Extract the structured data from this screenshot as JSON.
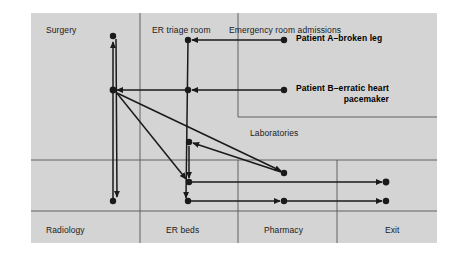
{
  "diagram": {
    "background_color": "#ffffff",
    "panel_color": "#d4d4d4",
    "line_color": "#1a1a1a",
    "grid_color": "#555555",
    "zones": [
      {
        "id": "surgery",
        "label": "Surgery",
        "x": 46,
        "y": 25,
        "align": "left"
      },
      {
        "id": "er-triage",
        "label": "ER triage room",
        "x": 152,
        "y": 25,
        "align": "left"
      },
      {
        "id": "er-admit",
        "label": "Emergency room admissions",
        "x": 229,
        "y": 25,
        "align": "left"
      },
      {
        "id": "laboratories",
        "label": "Laboratories",
        "x": 250,
        "y": 128,
        "align": "left"
      },
      {
        "id": "radiology",
        "label": "Radiology",
        "x": 46,
        "y": 225,
        "align": "left"
      },
      {
        "id": "er-beds",
        "label": "ER beds",
        "x": 166,
        "y": 225,
        "align": "left"
      },
      {
        "id": "pharmacy",
        "label": "Pharmacy",
        "x": 264,
        "y": 225,
        "align": "left"
      },
      {
        "id": "exit",
        "label": "Exit",
        "x": 385,
        "y": 225,
        "align": "left"
      }
    ],
    "patients": [
      {
        "id": "patient-a",
        "line1": "Patient A–broken leg",
        "line2": "",
        "x": 296,
        "y": 33
      },
      {
        "id": "patient-b",
        "line1": "Patient B–erratic heart",
        "line2": "pacemaker",
        "x": 296,
        "y": 83
      }
    ],
    "grid_lines": [
      {
        "id": "vline-surgery-erbeds",
        "orientation": "vertical",
        "x1": 140,
        "y1": 13,
        "x2": 140,
        "y2": 243
      },
      {
        "id": "vline-ertriage-right",
        "orientation": "vertical",
        "x1": 238,
        "y1": 13,
        "x2": 238,
        "y2": 117
      },
      {
        "id": "vline-lab-pharmacy",
        "orientation": "vertical",
        "x1": 238,
        "y1": 160,
        "x2": 238,
        "y2": 243
      },
      {
        "id": "vline-pharmacy-exit",
        "orientation": "vertical",
        "x1": 337,
        "y1": 160,
        "x2": 337,
        "y2": 243
      },
      {
        "id": "hline-upper-right",
        "orientation": "horizontal",
        "x1": 238,
        "y1": 117,
        "x2": 437,
        "y2": 117
      },
      {
        "id": "hline-mid-full",
        "orientation": "horizontal",
        "x1": 31,
        "y1": 160,
        "x2": 437,
        "y2": 160
      },
      {
        "id": "hline-bottom-full",
        "orientation": "horizontal",
        "x1": 31,
        "y1": 211,
        "x2": 437,
        "y2": 211
      }
    ],
    "nodes": [
      {
        "id": "node-surgery",
        "x": 113,
        "y": 36,
        "r": 3.2
      },
      {
        "id": "node-ertriage-a",
        "x": 188,
        "y": 40,
        "r": 3.2
      },
      {
        "id": "node-admissions-a",
        "x": 284,
        "y": 40,
        "r": 3.2
      },
      {
        "id": "node-left-mid",
        "x": 113,
        "y": 90,
        "r": 3.4
      },
      {
        "id": "node-ertriage-b",
        "x": 188,
        "y": 90,
        "r": 3.2
      },
      {
        "id": "node-admissions-b",
        "x": 284,
        "y": 90,
        "r": 3.2
      },
      {
        "id": "node-lab-top",
        "x": 189,
        "y": 142,
        "r": 3.2
      },
      {
        "id": "node-lab-right",
        "x": 284,
        "y": 173,
        "r": 3.2
      },
      {
        "id": "node-erbed-upper",
        "x": 189,
        "y": 182,
        "r": 3.2
      },
      {
        "id": "node-erbed-lower",
        "x": 188,
        "y": 201,
        "r": 3.2
      },
      {
        "id": "node-radiology",
        "x": 113,
        "y": 201,
        "r": 3.2
      },
      {
        "id": "node-pharmacy",
        "x": 284,
        "y": 201,
        "r": 3.2
      },
      {
        "id": "node-exit-upper",
        "x": 386,
        "y": 182,
        "r": 3.4
      },
      {
        "id": "node-exit-lower",
        "x": 386,
        "y": 201,
        "r": 3.2
      }
    ],
    "paths": [
      {
        "id": "path-admissionsA-to-triage",
        "x1": 284,
        "y1": 40,
        "x2": 192,
        "y2": 40,
        "arrow": "end"
      },
      {
        "id": "path-triageA-to-erbedlower",
        "x1": 188,
        "y1": 41,
        "x2": 186,
        "y2": 198,
        "arrow": "end"
      },
      {
        "id": "path-admissionsB-to-triageB",
        "x1": 284,
        "y1": 90,
        "x2": 192,
        "y2": 90,
        "arrow": "end"
      },
      {
        "id": "path-triageB-to-leftmid",
        "x1": 186,
        "y1": 90,
        "x2": 117,
        "y2": 90,
        "arrow": "end"
      },
      {
        "id": "path-radiology-to-surgery",
        "x1": 113,
        "y1": 199,
        "x2": 113,
        "y2": 42,
        "arrow": "end"
      },
      {
        "id": "path-surgery-to-radiology",
        "x1": 116,
        "y1": 39,
        "x2": 117,
        "y2": 197,
        "arrow": "end"
      },
      {
        "id": "path-leftmid-to-erbedupper",
        "x1": 116,
        "y1": 92,
        "x2": 186,
        "y2": 179,
        "arrow": "end"
      },
      {
        "id": "path-leftmid-to-labright",
        "x1": 117,
        "y1": 93,
        "x2": 281,
        "y2": 171,
        "arrow": "end"
      },
      {
        "id": "path-labtop-to-erbedupper",
        "x1": 189,
        "y1": 146,
        "x2": 189,
        "y2": 178,
        "arrow": "end"
      },
      {
        "id": "path-labright-to-labtop",
        "x1": 281,
        "y1": 172,
        "x2": 193,
        "y2": 143,
        "arrow": "end"
      },
      {
        "id": "path-erbedupper-to-exit",
        "x1": 189,
        "y1": 182,
        "x2": 382,
        "y2": 182,
        "arrow": "end"
      },
      {
        "id": "path-erbedlower-to-pharmacy",
        "x1": 188,
        "y1": 201,
        "x2": 280,
        "y2": 201,
        "arrow": "end"
      },
      {
        "id": "path-pharmacy-to-exit",
        "x1": 284,
        "y1": 201,
        "x2": 382,
        "y2": 201,
        "arrow": "end"
      }
    ]
  }
}
